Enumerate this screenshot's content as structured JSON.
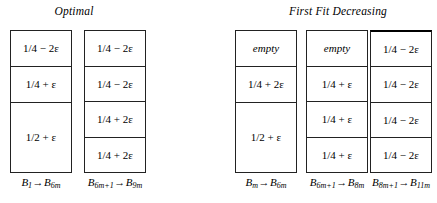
{
  "figure": {
    "groups": [
      {
        "id": "optimal",
        "title": "Optimal",
        "bins": [
          {
            "id": "opt-bin-1",
            "label": "B₁→B₆ₘ",
            "label_parts": {
              "from": "B",
              "from_sub": "1",
              "arrow": "→",
              "to": "B",
              "to_sub": "6m"
            },
            "cells": [
              {
                "text": "1/4 − 2ε",
                "kind": "item",
                "weight": 1
              },
              {
                "text": "1/4 + ε",
                "kind": "item",
                "weight": 1
              },
              {
                "text": "1/2 + ε",
                "kind": "item",
                "weight": 2
              }
            ]
          },
          {
            "id": "opt-bin-2",
            "label": "B₆ₘ₊₁→B₉ₘ",
            "label_parts": {
              "from": "B",
              "from_sub": "6m+1",
              "arrow": "→",
              "to": "B",
              "to_sub": "9m"
            },
            "cells": [
              {
                "text": "1/4 − 2ε",
                "kind": "item",
                "weight": 1
              },
              {
                "text": "1/4 − 2ε",
                "kind": "item",
                "weight": 1
              },
              {
                "text": "1/4 + 2ε",
                "kind": "item",
                "weight": 1
              },
              {
                "text": "1/4 + 2ε",
                "kind": "item",
                "weight": 1
              }
            ]
          }
        ]
      },
      {
        "id": "ffd",
        "title": "First Fit Decreasing",
        "bins": [
          {
            "id": "ffd-bin-1",
            "label": "Bₘ→B₆ₘ",
            "label_parts": {
              "from": "B",
              "from_sub": "m",
              "arrow": "→",
              "to": "B",
              "to_sub": "6m"
            },
            "cells": [
              {
                "text": "empty",
                "kind": "empty",
                "weight": 1
              },
              {
                "text": "1/4 + 2ε",
                "kind": "item",
                "weight": 1
              },
              {
                "text": "1/2 + ε",
                "kind": "item",
                "weight": 2
              }
            ]
          },
          {
            "id": "ffd-bin-2",
            "label": "B₆ₘ₊₁→B₈ₘ",
            "label_parts": {
              "from": "B",
              "from_sub": "6m+1",
              "arrow": "→",
              "to": "B",
              "to_sub": "8m"
            },
            "cells": [
              {
                "text": "empty",
                "kind": "empty",
                "weight": 1
              },
              {
                "text": "1/4 + ε",
                "kind": "item",
                "weight": 1
              },
              {
                "text": "1/4 + ε",
                "kind": "item",
                "weight": 1
              },
              {
                "text": "1/4 + ε",
                "kind": "item",
                "weight": 1
              }
            ]
          },
          {
            "id": "ffd-bin-3",
            "label": "B₈ₘ₊₁→B₁₁ₘ",
            "label_parts": {
              "from": "B",
              "from_sub": "8m+1",
              "arrow": "→",
              "to": "B",
              "to_sub": "11m"
            },
            "cells": [
              {
                "text": "1/4 − 2ε",
                "kind": "item",
                "weight": 1
              },
              {
                "text": "1/4 − 2ε",
                "kind": "item",
                "weight": 1
              },
              {
                "text": "1/4 − 2ε",
                "kind": "item",
                "weight": 1
              },
              {
                "text": "1/4 − 2ε",
                "kind": "item",
                "weight": 1
              }
            ]
          }
        ]
      }
    ],
    "colors": {
      "background": "#ffffff",
      "ink": "#000000",
      "rule": "#222222"
    }
  }
}
